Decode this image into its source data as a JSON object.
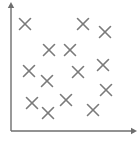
{
  "figure": {
    "width": 138,
    "height": 142,
    "background": "#ffffff"
  },
  "chart_data": {
    "type": "scatter",
    "title": "",
    "subtitle": "",
    "xlabel": "",
    "ylabel": "",
    "xlim": [
      0,
      100
    ],
    "ylim": [
      0,
      100
    ],
    "grid": false,
    "legend": null,
    "tick_labels": {
      "x": [],
      "y": []
    },
    "annotations": [],
    "marker": {
      "symbol": "x",
      "color": "#7a7a7a",
      "size_px": 11,
      "stroke_width": 1.6
    },
    "axes": {
      "color": "#6e6e6e",
      "stroke_width": 1.4,
      "origin_px": [
        11,
        131
      ],
      "x_axis_end_px": [
        133,
        131
      ],
      "y_axis_end_px": [
        11,
        6
      ],
      "arrowheads": true
    },
    "series": [
      {
        "name": "points",
        "color": "#7a7a7a",
        "points_px": [
          [
            25,
            24
          ],
          [
            83,
            24
          ],
          [
            105,
            32
          ],
          [
            49,
            50
          ],
          [
            70,
            50
          ],
          [
            29,
            71
          ],
          [
            47,
            81
          ],
          [
            78,
            72
          ],
          [
            103,
            65
          ],
          [
            106,
            90
          ],
          [
            32,
            103
          ],
          [
            48,
            113
          ],
          [
            66,
            100
          ],
          [
            93,
            110
          ]
        ],
        "x": [
          11.5,
          59.0,
          77.0,
          31.2,
          48.4,
          14.8,
          29.5,
          54.9,
          75.4,
          77.9,
          17.2,
          30.3,
          45.1,
          67.2
        ],
        "y": [
          85.6,
          85.6,
          79.2,
          64.8,
          64.8,
          48.0,
          40.0,
          47.2,
          52.8,
          32.8,
          22.4,
          14.4,
          24.8,
          16.8
        ]
      }
    ],
    "point_count": 14
  }
}
